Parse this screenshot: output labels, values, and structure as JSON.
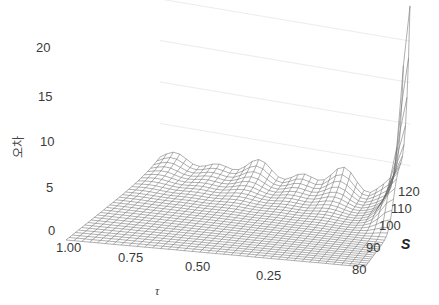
{
  "chart_data": {
    "type": "surface",
    "title": "",
    "zlabel": "오차",
    "xlabel": "τ",
    "ylabel": "S",
    "z_ticks": [
      "0",
      "5",
      "10",
      "15",
      "20"
    ],
    "x_ticks": [
      "1.00",
      "0.75",
      "0.50",
      "0.25"
    ],
    "y_ticks": [
      "80",
      "90",
      "100",
      "110",
      "120"
    ],
    "zlim": [
      0,
      22
    ],
    "xlim": [
      1.0,
      0.0
    ],
    "ylim": [
      80,
      125
    ],
    "grid": true,
    "samples": [
      {
        "tau": 1.0,
        "S": 80,
        "z": 0
      },
      {
        "tau": 0.5,
        "S": 100,
        "z": 0.2
      },
      {
        "tau": 0.5,
        "S": 125,
        "z": 3
      },
      {
        "tau": 0.25,
        "S": 125,
        "z": 3.5
      },
      {
        "tau": 0.05,
        "S": 110,
        "z": 4
      },
      {
        "tau": 0.0,
        "S": 120,
        "z": 10
      },
      {
        "tau": 0.0,
        "S": 125,
        "z": 22
      }
    ]
  },
  "labels": {
    "zlabel": "오차",
    "xlabel": "τ",
    "slabel": "S",
    "z": [
      "20",
      "15",
      "10",
      "5",
      "0"
    ],
    "x": [
      "1.00",
      "0.75",
      "0.50",
      "0.25"
    ],
    "s": [
      "120",
      "110",
      "100",
      "90",
      "80"
    ]
  }
}
